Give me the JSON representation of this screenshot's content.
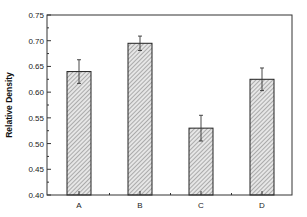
{
  "chart_data": {
    "type": "bar",
    "title": "",
    "xlabel": "",
    "ylabel": "Relative Density",
    "categories": [
      "A",
      "B",
      "C",
      "D"
    ],
    "values": [
      0.64,
      0.695,
      0.53,
      0.625
    ],
    "errors": [
      0.023,
      0.014,
      0.025,
      0.022
    ],
    "ylim": [
      0.4,
      0.75
    ],
    "yticks": [
      "0.40",
      "0.45",
      "0.50",
      "0.55",
      "0.60",
      "0.65",
      "0.70",
      "0.75"
    ],
    "grid": false,
    "legend": null,
    "bar_fill": "hatched",
    "colors": {
      "bar_fill": "#d8d8d8",
      "hatch": "#7a7a7a",
      "outline": "#222222",
      "axis": "#333333"
    }
  }
}
